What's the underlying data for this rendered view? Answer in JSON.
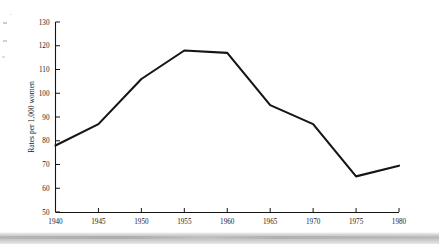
{
  "figure": {
    "background_color": "#ffffff",
    "frame_color": "#8a8a8a",
    "line_color": "#151515"
  },
  "chart_data": {
    "type": "line",
    "title": "",
    "subtitle": "",
    "xlabel": "",
    "ylabel": "Rates per 1,000 women",
    "x": [
      1940,
      1945,
      1950,
      1955,
      1960,
      1965,
      1970,
      1975,
      1980
    ],
    "values": [
      78,
      87,
      106,
      118,
      117,
      95,
      87,
      65,
      69.5
    ],
    "series": [
      {
        "name": "Birth rate",
        "values": [
          78,
          87,
          106,
          118,
          117,
          95,
          87,
          65,
          69.5
        ]
      }
    ],
    "xlim": [
      1940,
      1980
    ],
    "ylim": [
      50,
      130
    ],
    "xticks": [
      1940,
      1945,
      1950,
      1955,
      1960,
      1965,
      1970,
      1975,
      1980
    ],
    "xtick_labels": [
      "1940",
      "1945",
      "1950",
      "1955",
      "1960",
      "1965",
      "1970",
      "1975",
      "1980"
    ],
    "yticks": [
      50,
      60,
      70,
      80,
      90,
      100,
      110,
      120,
      130
    ],
    "ytick_labels": [
      "50",
      "60",
      "70",
      "80",
      "90",
      "100",
      "110",
      "120",
      "130"
    ],
    "grid": false,
    "legend": false,
    "legend_position": "none",
    "annotations": []
  }
}
